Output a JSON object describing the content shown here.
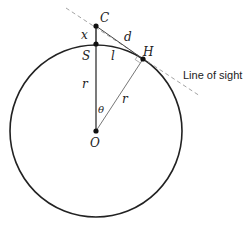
{
  "diagram": {
    "points": {
      "C": "C",
      "S": "S",
      "H": "H",
      "O": "O"
    },
    "segment_labels": {
      "x": "x",
      "d": "d",
      "l": "l",
      "r_vertical": "r",
      "r_slant": "r",
      "theta": "θ"
    },
    "annotation": "Line of sight",
    "colors": {
      "circle": "#222222",
      "lines": "#555555",
      "dashed": "#999999",
      "points": "#111111"
    }
  }
}
